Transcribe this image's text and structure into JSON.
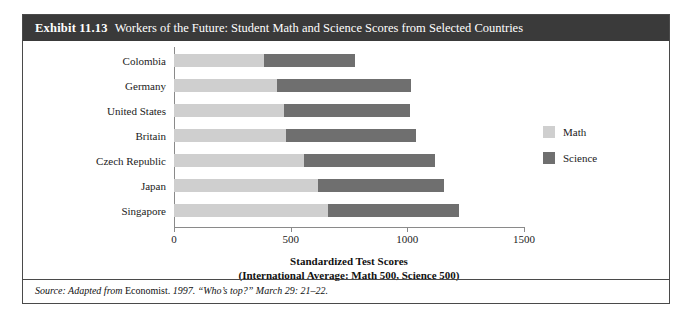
{
  "exhibit": {
    "number": "Exhibit 11.13",
    "title": "Workers of the Future: Student Math and Science Scores from Selected Countries",
    "source_prefix": "Source: Adapted from",
    "source_publication": "Economist.",
    "source_rest": "1997. “Who’s top?” March 29: 21–22."
  },
  "legend": {
    "items": [
      {
        "label": "Math",
        "color": "#cfcfcf"
      },
      {
        "label": "Science",
        "color": "#6f6f6f"
      }
    ]
  },
  "axis": {
    "title_line1": "Standardized Test Scores",
    "title_line2": "(International Average: Math 500, Science 500)",
    "ticks": [
      "0",
      "500",
      "1000",
      "1500"
    ]
  },
  "chart_data": {
    "type": "bar",
    "orientation": "horizontal",
    "stacked": true,
    "title": "Workers of the Future: Student Math and Science Scores from Selected Countries",
    "xlabel": "Standardized Test Scores (International Average: Math 500, Science 500)",
    "ylabel": "",
    "xlim": [
      0,
      1500
    ],
    "xticks": [
      0,
      500,
      1000,
      1500
    ],
    "grid": false,
    "legend_position": "right",
    "categories": [
      "Colombia",
      "Germany",
      "United States",
      "Britain",
      "Czech Republic",
      "Japan",
      "Singapore"
    ],
    "series": [
      {
        "name": "Math",
        "color": "#cfcfcf",
        "values": [
          385,
          440,
          470,
          480,
          555,
          615,
          660
        ]
      },
      {
        "name": "Science",
        "color": "#6f6f6f",
        "values": [
          390,
          575,
          540,
          555,
          565,
          540,
          560
        ]
      }
    ],
    "totals": [
      775,
      1015,
      1010,
      1035,
      1120,
      1155,
      1220
    ]
  }
}
